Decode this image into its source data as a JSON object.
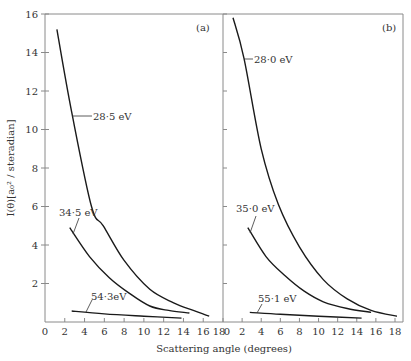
{
  "chart_data": [
    {
      "panel": "(a)",
      "type": "line",
      "xlabel": "Scattering angle (degrees)",
      "ylabel": "I(θ)[a₀² / steradian]",
      "xlim": [
        0,
        18
      ],
      "ylim": [
        0,
        16
      ],
      "xticks": [
        "0",
        "2",
        "4",
        "6",
        "8",
        "10",
        "12",
        "14",
        "16",
        "18"
      ],
      "yticks": [
        "2",
        "4",
        "6",
        "8",
        "10",
        "12",
        "14",
        "16"
      ],
      "grid": false,
      "series": [
        {
          "name": "28·5 eV",
          "x": [
            1.2,
            2.7,
            4.7,
            5.9,
            8.0,
            10.6,
            13.0,
            15.0,
            16.6
          ],
          "y": [
            15.2,
            10.9,
            6.0,
            5.0,
            3.2,
            1.7,
            1.0,
            0.6,
            0.3
          ]
        },
        {
          "name": "34·5 eV",
          "x": [
            2.5,
            4.5,
            6.5,
            8.5,
            10.6,
            12.5,
            14.6
          ],
          "y": [
            4.9,
            3.4,
            2.3,
            1.5,
            0.83,
            0.6,
            0.47
          ]
        },
        {
          "name": "54·3eV",
          "x": [
            2.7,
            6.0,
            10.0,
            13.8
          ],
          "y": [
            0.57,
            0.42,
            0.3,
            0.2
          ]
        }
      ]
    },
    {
      "panel": "(b)",
      "type": "line",
      "xlabel": "Scattering angle (degrees)",
      "ylabel": "I(θ)[a₀² / steradian]",
      "xlim": [
        0,
        18
      ],
      "ylim": [
        0,
        16
      ],
      "xticks": [
        "0",
        "2",
        "4",
        "6",
        "8",
        "10",
        "12",
        "14",
        "16",
        "18"
      ],
      "yticks": [
        "2",
        "4",
        "6",
        "8",
        "10",
        "12",
        "14",
        "16"
      ],
      "grid": false,
      "series": [
        {
          "name": "28·0 eV",
          "x": [
            1.05,
            2.2,
            4.0,
            5.8,
            8.0,
            10.5,
            13.0,
            15.5,
            18.2
          ],
          "y": [
            15.8,
            13.7,
            9.0,
            6.1,
            3.9,
            2.2,
            1.2,
            0.6,
            0.3
          ]
        },
        {
          "name": "35·0 eV",
          "x": [
            2.6,
            4.5,
            6.5,
            8.5,
            10.5,
            13.0,
            15.5
          ],
          "y": [
            4.9,
            3.4,
            2.4,
            1.6,
            1.05,
            0.7,
            0.5
          ]
        },
        {
          "name": "55·1 eV",
          "x": [
            2.8,
            6.0,
            10.0,
            14.5
          ],
          "y": [
            0.5,
            0.4,
            0.3,
            0.2
          ]
        }
      ]
    }
  ],
  "labels": {
    "panel_a": "(a)",
    "panel_b": "(b)",
    "xlabel": "Scattering angle (degrees)",
    "ylabel": "I(θ)[a₀² / steradian]",
    "a_curve1": "28·5 eV",
    "a_curve2": "34·5 eV",
    "a_curve3": "54·3eV",
    "b_curve1": "28·0 eV",
    "b_curve2": "35·0 eV",
    "b_curve3": "55·1 eV"
  },
  "colors": {
    "axis": "#8a8a8a",
    "curve": "#1a1a1a",
    "text": "#333333"
  }
}
